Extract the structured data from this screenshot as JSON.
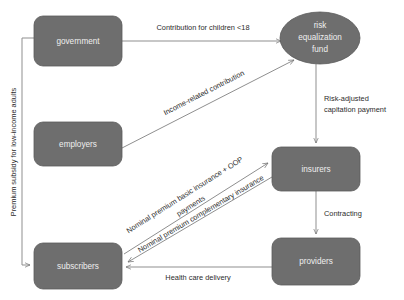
{
  "diagram": {
    "colors": {
      "node_fill": "#6e6e6e",
      "node_stroke": "#5a5a5a",
      "node_text": "#efefef",
      "edge": "#8f8f8f",
      "label_text": "#2b2b2b",
      "background": "#ffffff"
    },
    "nodes": [
      {
        "id": "government",
        "label": "government",
        "shape": "rounded-rect",
        "x": 34,
        "y": 16,
        "w": 88,
        "h": 50
      },
      {
        "id": "employers",
        "label": "employers",
        "shape": "rounded-rect",
        "x": 34,
        "y": 122,
        "w": 88,
        "h": 44
      },
      {
        "id": "subscribers",
        "label": "subscribers",
        "shape": "rounded-rect",
        "x": 34,
        "y": 243,
        "w": 88,
        "h": 46
      },
      {
        "id": "insurers",
        "label": "insurers",
        "shape": "rounded-rect",
        "x": 272,
        "y": 147,
        "w": 88,
        "h": 44
      },
      {
        "id": "providers",
        "label": "providers",
        "shape": "rounded-rect",
        "x": 272,
        "y": 238,
        "w": 88,
        "h": 47
      },
      {
        "id": "risk-equalization-fund",
        "label_lines": [
          "risk",
          "equalization",
          "fund"
        ],
        "shape": "ellipse",
        "cx": 320,
        "cy": 38,
        "rx": 40,
        "ry": 26
      }
    ],
    "edges": [
      {
        "id": "government-to-fund",
        "from": "government",
        "to": "risk-equalization-fund",
        "label": "Contribution for children <18"
      },
      {
        "id": "employers-to-fund",
        "from": "employers",
        "to": "risk-equalization-fund",
        "label": "Income-related contribution"
      },
      {
        "id": "fund-to-insurers",
        "from": "risk-equalization-fund",
        "to": "insurers",
        "label_lines": [
          "Risk-adjusted",
          "capitation payment"
        ]
      },
      {
        "id": "insurers-to-providers",
        "from": "insurers",
        "to": "providers",
        "label": "Contracting"
      },
      {
        "id": "providers-to-subscribers",
        "from": "providers",
        "to": "subscribers",
        "label": "Health care delivery"
      },
      {
        "id": "subscribers-to-insurers-basic",
        "from": "subscribers",
        "to": "insurers",
        "label_lines": [
          "Nominal premium basic insurance + OOP",
          "payments"
        ]
      },
      {
        "id": "subscribers-to-insurers-complementary",
        "from": "subscribers",
        "to": "insurers",
        "label": "Nominal premium complementary insurance"
      },
      {
        "id": "government-to-subscribers-subsidy",
        "from": "government",
        "to": "subscribers",
        "label": "Premium subsidy for low-income adults"
      }
    ],
    "labels": {
      "contribution_children": "Contribution for children <18",
      "income_related": "Income-related contribution",
      "risk_adjusted_line1": "Risk-adjusted",
      "risk_adjusted_line2": "capitation payment",
      "contracting": "Contracting",
      "health_care_delivery": "Health care delivery",
      "nominal_basic_line1": "Nominal premium basic insurance + OOP",
      "nominal_basic_line2": "payments",
      "nominal_complementary": "Nominal premium complementary insurance",
      "premium_subsidy": "Premium subsidy for low-income adults",
      "node_government": "government",
      "node_employers": "employers",
      "node_subscribers": "subscribers",
      "node_insurers": "insurers",
      "node_providers": "providers",
      "node_fund_line1": "risk",
      "node_fund_line2": "equalization",
      "node_fund_line3": "fund"
    }
  }
}
